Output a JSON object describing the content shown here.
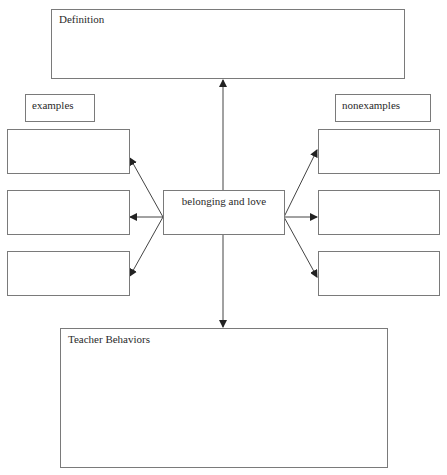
{
  "diagram": {
    "center": {
      "label": "belonging and love"
    },
    "definition": {
      "label": "Definition"
    },
    "examples": {
      "label": "examples",
      "boxes": [
        "",
        "",
        ""
      ]
    },
    "nonexamples": {
      "label": "nonexamples",
      "boxes": [
        "",
        "",
        ""
      ]
    },
    "teacher_behaviors": {
      "label": "Teacher Behaviors"
    }
  }
}
